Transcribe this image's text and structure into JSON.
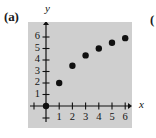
{
  "figure": {
    "panel_label": "(a)",
    "next_panel_label": "(",
    "x_axis_name": "x",
    "y_axis_name": "y"
  },
  "chart_data": {
    "type": "scatter",
    "title": "",
    "subtitle": "",
    "xlabel": "x",
    "ylabel": "y",
    "xlim": [
      0,
      6.6
    ],
    "ylim": [
      0,
      6.6
    ],
    "grid": false,
    "legend": null,
    "xticks": [
      1,
      2,
      3,
      4,
      5,
      6
    ],
    "yticks": [
      1,
      2,
      3,
      4,
      5,
      6
    ],
    "xtick_labels": [
      "1",
      "2",
      "3",
      "4",
      "5",
      "6"
    ],
    "ytick_labels": [
      "1",
      "2",
      "3",
      "4",
      "5",
      "6"
    ],
    "series": [
      {
        "name": "data",
        "marker": "filled-circle",
        "color": "#101010",
        "points": [
          {
            "x": 0,
            "y": 0
          },
          {
            "x": 1,
            "y": 2.0
          },
          {
            "x": 2,
            "y": 3.5
          },
          {
            "x": 3,
            "y": 4.4
          },
          {
            "x": 4,
            "y": 5.0
          },
          {
            "x": 5,
            "y": 5.5
          },
          {
            "x": 6,
            "y": 5.9
          }
        ]
      }
    ],
    "annotations": []
  },
  "style": {
    "panel_background": "#cfcfcf",
    "page_background": "#ffffff",
    "axis_color": "#111111",
    "marker_color": "#101010"
  }
}
